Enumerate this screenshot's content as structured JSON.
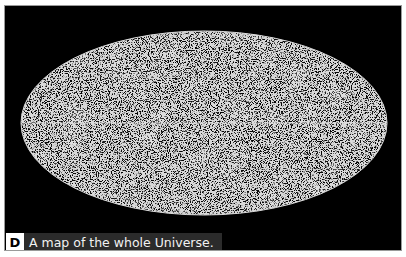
{
  "figure": {
    "label": "D",
    "caption": "A map of the whole Universe.",
    "colors": {
      "background": "#000000",
      "points": "#ffffff",
      "caption_bg": "#2b2b2b",
      "caption_text": "#f2f2f2",
      "label_bg": "#ffffff",
      "label_text": "#000000"
    }
  }
}
